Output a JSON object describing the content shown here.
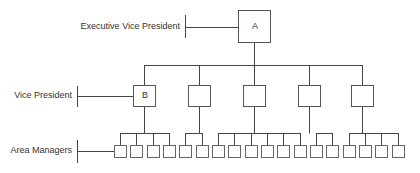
{
  "levels": [
    {
      "label": "Executive Vice President",
      "count": 1
    },
    {
      "label": "Vice President",
      "count": 5
    },
    {
      "label": "Area Managers",
      "count": 18
    }
  ],
  "nodes": {
    "executive_vice_president": {
      "label": "A"
    },
    "vice_presidents": [
      {
        "label": "B",
        "area_managers": 4
      },
      {
        "label": "",
        "area_managers": 2
      },
      {
        "label": "",
        "area_managers": 6
      },
      {
        "label": "",
        "area_managers": 2
      },
      {
        "label": "",
        "area_managers": 4
      }
    ]
  },
  "colors": {
    "line": "#444444",
    "box_border": "#555555",
    "text": "#333333",
    "background": "#ffffff"
  }
}
